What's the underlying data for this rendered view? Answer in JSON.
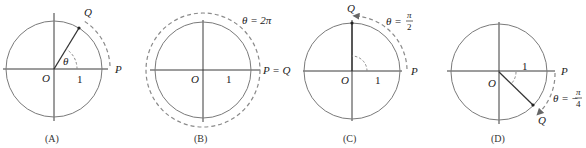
{
  "figure": {
    "panels": [
      {
        "id": "A",
        "caption": "(A)",
        "origin_label": "O",
        "unit_label": "1",
        "p_label": "P",
        "q_label": "Q",
        "angle_label": "θ",
        "angle_description": "positive angle θ (approx. 60°)"
      },
      {
        "id": "B",
        "caption": "(B)",
        "origin_label": "O",
        "unit_label": "1",
        "pq_label": "P = Q",
        "angle_label": "θ = 2π"
      },
      {
        "id": "C",
        "caption": "(C)",
        "origin_label": "O",
        "unit_label": "1",
        "p_label": "P",
        "q_label": "Q",
        "angle_label_prefix": "θ =",
        "angle_num": "π",
        "angle_den": "2"
      },
      {
        "id": "D",
        "caption": "(D)",
        "origin_label": "O",
        "unit_label": "1",
        "p_label": "P",
        "q_label": "Q",
        "angle_label_prefix": "θ = −",
        "angle_num": "π",
        "angle_den": "4"
      }
    ]
  }
}
